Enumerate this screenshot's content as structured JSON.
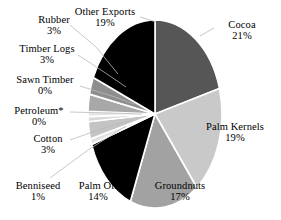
{
  "chart_data": {
    "type": "pie",
    "title": "",
    "subtitle": "",
    "xlabel": "",
    "ylabel": "",
    "legend_position": "labels-with-leader-lines",
    "grid": false,
    "start_angle_deg": 0,
    "direction": "clockwise",
    "categories": [
      "Cocoa",
      "Palm Kernels",
      "Groundnuts",
      "Palm Oil",
      "Benniseed",
      "Cotton",
      "Petroleum*",
      "Sawn Timber",
      "Timber Logs",
      "Rubber",
      "Other Exports"
    ],
    "values": [
      21,
      19,
      17,
      14,
      1,
      3,
      0,
      0,
      3,
      3,
      19
    ],
    "value_labels": [
      "21%",
      "19%",
      "17%",
      "14%",
      "1%",
      "3%",
      "0%",
      "0%",
      "3%",
      "3%",
      "19%"
    ],
    "unit": "%",
    "colors": [
      "#565656",
      "#c9c9c9",
      "#a2a2a2",
      "#000000",
      "#e2e2e2",
      "#c4c4c4",
      "#d8d8d8",
      "#e6e6e6",
      "#a8a8a8",
      "#8e8e8e",
      "#000000"
    ],
    "slices": [
      {
        "label": "Cocoa",
        "percent": 21,
        "percent_text": "21%",
        "color": "#565656"
      },
      {
        "label": "Palm Kernels",
        "percent": 19,
        "percent_text": "19%",
        "color": "#c9c9c9"
      },
      {
        "label": "Groundnuts",
        "percent": 17,
        "percent_text": "17%",
        "color": "#a2a2a2"
      },
      {
        "label": "Palm Oil",
        "percent": 14,
        "percent_text": "14%",
        "color": "#000000"
      },
      {
        "label": "Benniseed",
        "percent": 1,
        "percent_text": "1%",
        "color": "#e2e2e2"
      },
      {
        "label": "Cotton",
        "percent": 3,
        "percent_text": "3%",
        "color": "#c4c4c4"
      },
      {
        "label": "Petroleum*",
        "percent": 0,
        "percent_text": "0%",
        "color": "#d8d8d8"
      },
      {
        "label": "Sawn Timber",
        "percent": 0,
        "percent_text": "0%",
        "color": "#e6e6e6"
      },
      {
        "label": "Timber Logs",
        "percent": 3,
        "percent_text": "3%",
        "color": "#a8a8a8"
      },
      {
        "label": "Rubber",
        "percent": 3,
        "percent_text": "3%",
        "color": "#8e8e8e"
      },
      {
        "label": "Other Exports",
        "percent": 19,
        "percent_text": "19%",
        "color": "#000000"
      }
    ]
  },
  "labels": {
    "cocoa": {
      "name": "Cocoa",
      "pct": "21%"
    },
    "palm_kernels": {
      "name": "Palm Kernels",
      "pct": "19%"
    },
    "groundnuts": {
      "name": "Groundnuts",
      "pct": "17%"
    },
    "palm_oil": {
      "name": "Palm Oil",
      "pct": "14%"
    },
    "benniseed": {
      "name": "Benniseed",
      "pct": "1%"
    },
    "cotton": {
      "name": "Cotton",
      "pct": "3%"
    },
    "petroleum": {
      "name": "Petroleum*",
      "pct": "0%"
    },
    "sawn_timber": {
      "name": "Sawn Timber",
      "pct": "0%"
    },
    "timber_logs": {
      "name": "Timber Logs",
      "pct": "3%"
    },
    "rubber": {
      "name": "Rubber",
      "pct": "3%"
    },
    "other_exports": {
      "name": "Other Exports",
      "pct": "19%"
    }
  },
  "style": {
    "background": "#ffffff",
    "text_color": "#000000",
    "slice_gap_color": "#ffffff",
    "leader_line_color": "#b9b9b9"
  }
}
